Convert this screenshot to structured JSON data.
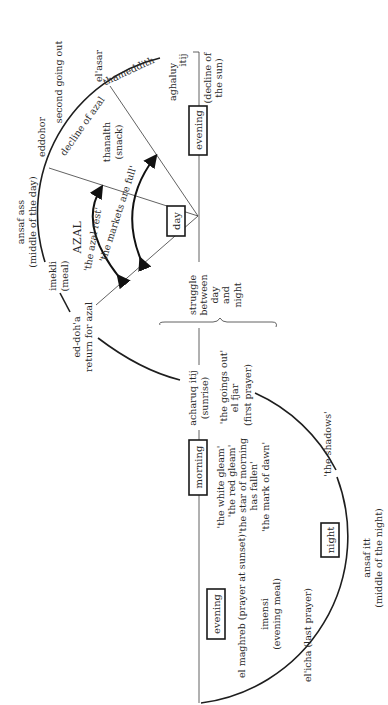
{
  "diagram": {
    "orientation": "rotated -90deg",
    "periods": {
      "day": "day",
      "evening_top": "evening",
      "morning": "morning",
      "evening_bottom": "evening",
      "night": "night"
    },
    "day_arc_labels": {
      "aghaluy": "aghaluy",
      "aghaluy2": "itij",
      "decline_sun1": "(decline of",
      "decline_sun2": "the sun)",
      "thameddith": "thameddith",
      "el_asar": "el'asar",
      "second_going_out": "second going out",
      "decline_azal": "decline of azal",
      "eddohor": "eddohor",
      "thanalth": "thanalth",
      "snack": "(snack)",
      "ansaf_ass": "ansaf ass",
      "middle_day": "(middle of the day)",
      "azal": "AZAL",
      "azal_rest": "'the azal rest'",
      "markets_full": "'the markets are full'",
      "imekli": "imekli",
      "meal": "(meal)",
      "ed_doha": "ed-doh'a",
      "return_azal": "return for azal"
    },
    "struggle": [
      "struggle",
      "between",
      "day",
      "and",
      "night"
    ],
    "morning_labels": {
      "acharuq": "acharuq itij",
      "sunrise": "(sunrise)",
      "goings_out": "'the goings out'",
      "el_fjar": "el fjar",
      "first_prayer": "(first prayer)",
      "white_gleam": "'the white gleam'",
      "red_gleam": "'the red gleam'",
      "star_morning": "'the star of morning",
      "has_fallen": "has fallen'",
      "mark_dawn": "'the mark of dawn'",
      "shadows": "'the shadows'"
    },
    "night_labels": {
      "ansaf_itt": "ansaf itt",
      "middle_night": "(middle of the night)",
      "el_maghreb": "el maghreb (prayer at sunset)",
      "imensi": "imensi",
      "evening_meal": "(evening meal)",
      "el_icha": "el'icha (last prayer)"
    }
  }
}
